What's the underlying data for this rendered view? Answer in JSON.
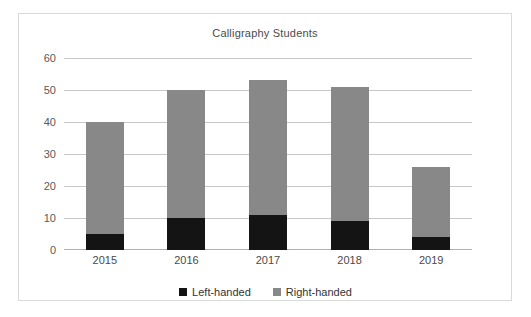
{
  "chart_data": {
    "type": "bar",
    "subtype": "stacked-column",
    "title": "Calligraphy Students",
    "xlabel": "",
    "ylabel": "",
    "categories": [
      "2015",
      "2016",
      "2017",
      "2018",
      "2019"
    ],
    "series": [
      {
        "name": "Left-handed",
        "color": "#141414",
        "values": [
          5,
          10,
          11,
          9,
          4
        ]
      },
      {
        "name": "Right-handed",
        "color": "#888888",
        "values": [
          35,
          40,
          42,
          42,
          22
        ]
      }
    ],
    "totals": [
      40,
      50,
      53,
      51,
      26
    ],
    "ylim": [
      0,
      60
    ],
    "ytick_step": 10,
    "yticks": [
      "60",
      "50",
      "40",
      "30",
      "20",
      "10",
      "0"
    ],
    "grid": true,
    "legend_position": "bottom"
  },
  "legend": {
    "items": [
      {
        "label": "Left-handed",
        "color": "#141414"
      },
      {
        "label": "Right-handed",
        "color": "#888888"
      }
    ]
  }
}
